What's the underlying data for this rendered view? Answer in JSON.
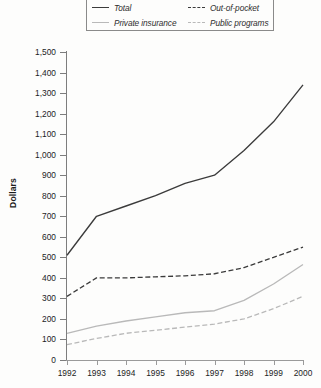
{
  "chart_data": {
    "type": "line",
    "title": "",
    "xlabel": "",
    "ylabel": "Dollars",
    "categories": [
      "1992",
      "1993",
      "1994",
      "1995",
      "1996",
      "1997",
      "1998",
      "1999",
      "2000"
    ],
    "x": [
      1992,
      1993,
      1994,
      1995,
      1996,
      1997,
      1998,
      1999,
      2000
    ],
    "ylim": [
      0,
      1500
    ],
    "yticks": [
      0,
      100,
      200,
      300,
      400,
      500,
      600,
      700,
      800,
      900,
      1000,
      1100,
      1200,
      1300,
      1400,
      1500
    ],
    "ytick_labels": [
      "0",
      "100",
      "200",
      "300",
      "400",
      "500",
      "600",
      "700",
      "800",
      "900",
      "1,000",
      "1,100",
      "1,200",
      "1,300",
      "1,400",
      "1,500"
    ],
    "grid": false,
    "legend_position": "top",
    "series": [
      {
        "name": "Total",
        "style": "solid",
        "color": "#3b3b3b",
        "values": [
          510,
          700,
          750,
          800,
          860,
          900,
          1020,
          1160,
          1340
        ]
      },
      {
        "name": "Out-of-pocket",
        "style": "dashed",
        "color": "#3b3b3b",
        "values": [
          310,
          400,
          400,
          405,
          410,
          420,
          450,
          500,
          550
        ]
      },
      {
        "name": "Private insurance",
        "style": "solid",
        "color": "#b9b9b9",
        "values": [
          130,
          165,
          190,
          210,
          230,
          240,
          290,
          370,
          465
        ]
      },
      {
        "name": "Public programs",
        "style": "dashed",
        "color": "#b9b9b9",
        "values": [
          75,
          105,
          130,
          145,
          160,
          175,
          200,
          250,
          310
        ]
      }
    ]
  },
  "legend": {
    "entries": [
      {
        "label": "Total",
        "swatch": "line-solid-dark-icon"
      },
      {
        "label": "Out-of-pocket",
        "swatch": "line-dashed-dark-icon"
      },
      {
        "label": "Private insurance",
        "swatch": "line-solid-light-icon"
      },
      {
        "label": "Public programs",
        "swatch": "line-dashed-light-icon"
      }
    ]
  }
}
